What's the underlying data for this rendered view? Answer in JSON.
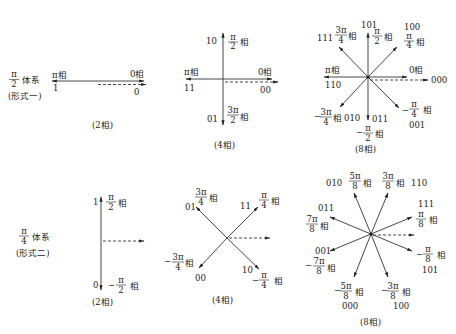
{
  "figure": {
    "systems": [
      {
        "id": "pi-over-2",
        "title_numerator": "π",
        "title_denominator": "2",
        "title_suffix": "体系",
        "form_label": "(形式一)",
        "diagrams": [
          {
            "caption": "(2相)",
            "phases": [
              {
                "phase": "π相",
                "code": "1"
              },
              {
                "phase": "0相",
                "code": "0"
              }
            ]
          },
          {
            "caption": "(4相)",
            "phases": [
              {
                "phase_num": "π",
                "phase_den": "2",
                "suffix": "相",
                "code": "10"
              },
              {
                "phase": "π相",
                "code": "11"
              },
              {
                "phase": "0相",
                "code": "00"
              },
              {
                "phase_num": "3π",
                "phase_den": "2",
                "suffix": "相",
                "code": "01"
              }
            ]
          },
          {
            "caption": "(8相)",
            "phases": [
              {
                "phase_num": "3π",
                "phase_den": "4",
                "suffix": "相",
                "code": "111"
              },
              {
                "phase_num": "π",
                "phase_den": "2",
                "suffix": "相",
                "code": "101"
              },
              {
                "phase_num": "π",
                "phase_den": "4",
                "suffix": "相",
                "code": "100"
              },
              {
                "phase": "π相",
                "code": "110"
              },
              {
                "phase": "0相",
                "code": "000"
              },
              {
                "phase_num": "3π",
                "phase_den": "4",
                "sign": "−",
                "suffix": "相",
                "code": "010"
              },
              {
                "phase_num": "π",
                "phase_den": "2",
                "sign": "−",
                "suffix": "相",
                "code": "011"
              },
              {
                "phase_num": "π",
                "phase_den": "4",
                "sign": "−",
                "suffix": "相",
                "code": "001"
              }
            ]
          }
        ]
      },
      {
        "id": "pi-over-4",
        "title_numerator": "π",
        "title_denominator": "4",
        "title_suffix": "体系",
        "form_label": "(形式二)",
        "diagrams": [
          {
            "caption": "(2相)",
            "phases": [
              {
                "phase_num": "π",
                "phase_den": "2",
                "suffix": "相",
                "code": "1"
              },
              {
                "phase_num": "π",
                "phase_den": "2",
                "sign": "−",
                "suffix": "相",
                "code": "0"
              }
            ]
          },
          {
            "caption": "(4相)",
            "phases": [
              {
                "phase_num": "3π",
                "phase_den": "4",
                "suffix": "相",
                "code": "01"
              },
              {
                "phase_num": "π",
                "phase_den": "4",
                "suffix": "相",
                "code": "11"
              },
              {
                "phase_num": "3π",
                "phase_den": "4",
                "sign": "−",
                "suffix": "相",
                "code": "00"
              },
              {
                "phase_num": "π",
                "phase_den": "4",
                "sign": "−",
                "suffix": "相",
                "code": "10"
              }
            ]
          },
          {
            "caption": "(8相)",
            "phases": [
              {
                "phase_num": "5π",
                "phase_den": "8",
                "suffix": "相",
                "code": "010"
              },
              {
                "phase_num": "3π",
                "phase_den": "8",
                "suffix": "相",
                "code": "110"
              },
              {
                "phase_num": "7π",
                "phase_den": "8",
                "suffix": "相",
                "code": "011"
              },
              {
                "phase_num": "π",
                "phase_den": "8",
                "suffix": "相",
                "code": "111"
              },
              {
                "phase_num": "7π",
                "phase_den": "8",
                "sign": "−",
                "suffix": "相",
                "code": "001"
              },
              {
                "phase_num": "π",
                "phase_den": "8",
                "sign": "−",
                "suffix": "相",
                "code": "101"
              },
              {
                "phase_num": "5π",
                "phase_den": "8",
                "sign": "−",
                "suffix": "相",
                "code": "000"
              },
              {
                "phase_num": "3π",
                "phase_den": "8",
                "sign": "−",
                "suffix": "相",
                "code": "100"
              }
            ]
          }
        ]
      }
    ],
    "glyphs": {
      "pi": "π",
      "xiang": "相",
      "minus": "−"
    }
  }
}
